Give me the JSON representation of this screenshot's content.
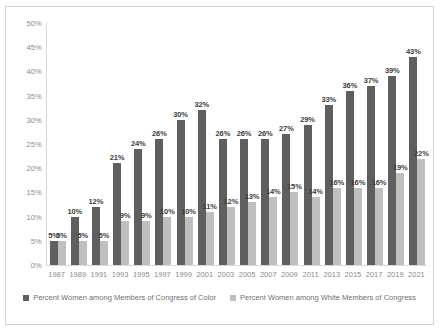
{
  "chart_data": {
    "type": "bar",
    "title": "",
    "xlabel": "",
    "ylabel": "",
    "ylim": [
      0,
      50
    ],
    "ytick_labels": [
      "0%",
      "5%",
      "10%",
      "15%",
      "20%",
      "25%",
      "30%",
      "35%",
      "40%",
      "45%",
      "50%"
    ],
    "ytick_values": [
      0,
      5,
      10,
      15,
      20,
      25,
      30,
      35,
      40,
      45,
      50
    ],
    "grid": false,
    "legend_position": "bottom",
    "categories": [
      "1987",
      "1989",
      "1991",
      "1993",
      "1995",
      "1997",
      "1999",
      "2001",
      "2003",
      "2005",
      "2007",
      "2009",
      "2011",
      "2013",
      "2015",
      "2017",
      "2019",
      "2021"
    ],
    "series": [
      {
        "name": "Percent Women among Members of Congress of Color",
        "color": "#5f5f5f",
        "values": [
          5,
          10,
          12,
          21,
          24,
          26,
          30,
          32,
          26,
          26,
          26,
          27,
          29,
          33,
          36,
          37,
          39,
          43
        ],
        "labels": [
          "5%",
          "10%",
          "12%",
          "21%",
          "24%",
          "26%",
          "30%",
          "32%",
          "26%",
          "26%",
          "26%",
          "27%",
          "29%",
          "33%",
          "36%",
          "37%",
          "39%",
          "43%"
        ]
      },
      {
        "name": "Percent Women among White Members of Congress",
        "color": "#bfbfbf",
        "values": [
          5,
          5,
          5,
          9,
          9,
          10,
          10,
          11,
          12,
          13,
          14,
          15,
          14,
          16,
          16,
          16,
          19,
          22
        ],
        "labels": [
          "5%",
          "5%",
          "5%",
          "9%",
          "9%",
          "10%",
          "10%",
          "11%",
          "12%",
          "13%",
          "14%",
          "15%",
          "14%",
          "16%",
          "16%",
          "16%",
          "19%",
          "22%"
        ]
      }
    ]
  }
}
